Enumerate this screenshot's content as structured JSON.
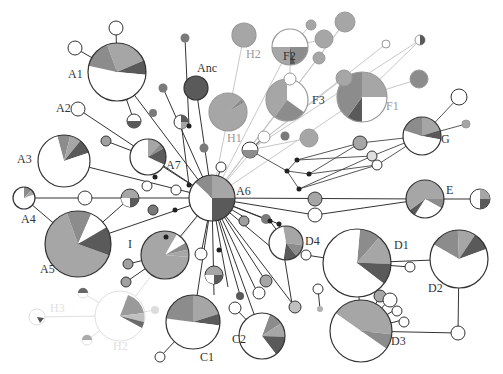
{
  "colors": {
    "c_light": "#a6a6a6",
    "c_mid": "#8c8c8c",
    "c_dark": "#5a5a5a",
    "c_white": "#ffffff",
    "c_solid": "#7a7a7a",
    "line_dark": "#333333",
    "line_light": "#c8c8c8",
    "ghost": "#dcdcdc"
  },
  "labels": [
    {
      "id": "A1",
      "text": "A1",
      "x": 68,
      "y": 78,
      "faded": false
    },
    {
      "id": "A2",
      "text": "A2",
      "x": 56,
      "y": 112,
      "faded": false
    },
    {
      "id": "A3",
      "text": "A3",
      "x": 17,
      "y": 163,
      "faded": false
    },
    {
      "id": "A4",
      "text": "A4",
      "x": 21,
      "y": 223,
      "faded": false
    },
    {
      "id": "A5",
      "text": "A5",
      "x": 40,
      "y": 273,
      "faded": false
    },
    {
      "id": "A6",
      "text": "A6",
      "x": 236,
      "y": 195,
      "faded": false
    },
    {
      "id": "A7",
      "text": "A7",
      "x": 166,
      "y": 169,
      "faded": false
    },
    {
      "id": "Anc",
      "text": "Anc",
      "x": 197,
      "y": 72,
      "faded": false
    },
    {
      "id": "H1",
      "text": "H1",
      "x": 227,
      "y": 142,
      "faded": true
    },
    {
      "id": "H2",
      "text": "H2",
      "x": 246,
      "y": 58,
      "faded": true
    },
    {
      "id": "F1",
      "text": "F1",
      "x": 386,
      "y": 110,
      "faded": true
    },
    {
      "id": "F2",
      "text": "F2",
      "x": 283,
      "y": 60,
      "faded": false
    },
    {
      "id": "F3",
      "text": "F3",
      "x": 312,
      "y": 104,
      "faded": false
    },
    {
      "id": "G",
      "text": "G",
      "x": 441,
      "y": 143,
      "faded": false
    },
    {
      "id": "E",
      "text": "E",
      "x": 446,
      "y": 194,
      "faded": false
    },
    {
      "id": "D1",
      "text": "D1",
      "x": 394,
      "y": 249,
      "faded": false
    },
    {
      "id": "D2",
      "text": "D2",
      "x": 428,
      "y": 292,
      "faded": false
    },
    {
      "id": "D3",
      "text": "D3",
      "x": 391,
      "y": 345,
      "faded": false
    },
    {
      "id": "D4",
      "text": "D4",
      "x": 305,
      "y": 245,
      "faded": false
    },
    {
      "id": "C1",
      "text": "C1",
      "x": 200,
      "y": 361,
      "faded": false
    },
    {
      "id": "C2",
      "text": "C2",
      "x": 232,
      "y": 343,
      "faded": false
    },
    {
      "id": "I",
      "text": "I",
      "x": 128,
      "y": 248,
      "faded": false
    },
    {
      "id": "H3",
      "text": "H3",
      "x": 50,
      "y": 312,
      "faded": true
    },
    {
      "id": "H2b",
      "text": "H2",
      "x": 113,
      "y": 350,
      "faded": true
    }
  ],
  "chart_data": {
    "type": "network",
    "title": "",
    "nodes": [
      {
        "id": "A1",
        "x": 117,
        "y": 72,
        "r": 29,
        "slices": [
          [
            "c_light",
            0.24
          ],
          [
            "c_dark",
            0.08
          ],
          [
            "c_white",
            0.52
          ],
          [
            "c_mid",
            0.16
          ]
        ],
        "start": -20
      },
      {
        "id": "A3",
        "x": 64,
        "y": 161,
        "r": 26,
        "slices": [
          [
            "c_mid",
            0.08
          ],
          [
            "c_light",
            0.07
          ],
          [
            "c_dark",
            0.09
          ],
          [
            "c_white",
            0.76
          ]
        ],
        "start": -15
      },
      {
        "id": "A4",
        "x": 24,
        "y": 198,
        "r": 11,
        "slices": [
          [
            "c_mid",
            0.12
          ],
          [
            "c_light",
            0.08
          ],
          [
            "c_white",
            0.8
          ]
        ],
        "start": 0
      },
      {
        "id": "A5",
        "x": 78,
        "y": 244,
        "r": 33,
        "slices": [
          [
            "c_light",
            0.64
          ],
          [
            "c_mid",
            0.12
          ],
          [
            "c_white",
            0.1
          ],
          [
            "c_dark",
            0.14
          ]
        ],
        "start": 110
      },
      {
        "id": "A6",
        "x": 212,
        "y": 198,
        "r": 23,
        "slices": [
          [
            "c_light",
            0.25
          ],
          [
            "c_dark",
            0.25
          ],
          [
            "c_white",
            0.37
          ],
          [
            "c_mid",
            0.13
          ]
        ],
        "start": 0
      },
      {
        "id": "A7",
        "x": 148,
        "y": 157,
        "r": 18,
        "slices": [
          [
            "c_light",
            0.12
          ],
          [
            "c_mid",
            0.05
          ],
          [
            "c_dark",
            0.15
          ],
          [
            "c_white",
            0.68
          ]
        ],
        "start": 0
      },
      {
        "id": "I",
        "x": 165,
        "y": 255,
        "r": 24,
        "slices": [
          [
            "c_light",
            0.82
          ],
          [
            "c_white",
            0.08
          ],
          [
            "c_mid",
            0.05
          ],
          [
            "c_light",
            0.05
          ]
        ],
        "start": 95
      },
      {
        "id": "C1",
        "x": 193,
        "y": 322,
        "r": 27,
        "slices": [
          [
            "c_light",
            0.2
          ],
          [
            "c_dark",
            0.07
          ],
          [
            "c_white",
            0.5
          ],
          [
            "c_mid",
            0.23
          ]
        ],
        "start": 0
      },
      {
        "id": "C2",
        "x": 262,
        "y": 336,
        "r": 23,
        "slices": [
          [
            "c_mid",
            0.1
          ],
          [
            "c_light",
            0.1
          ],
          [
            "c_dark",
            0.14
          ],
          [
            "c_white",
            0.66
          ]
        ],
        "start": 20
      },
      {
        "id": "D1",
        "x": 357,
        "y": 263,
        "r": 34,
        "slices": [
          [
            "c_mid",
            0.1
          ],
          [
            "c_light",
            0.14
          ],
          [
            "c_dark",
            0.1
          ],
          [
            "c_white",
            0.66
          ]
        ],
        "start": 5
      },
      {
        "id": "D2",
        "x": 459,
        "y": 259,
        "r": 29,
        "slices": [
          [
            "c_mid",
            0.16
          ],
          [
            "c_light",
            0.1
          ],
          [
            "c_dark",
            0.1
          ],
          [
            "c_white",
            0.64
          ]
        ],
        "start": -60
      },
      {
        "id": "D3",
        "x": 361,
        "y": 331,
        "r": 31,
        "slices": [
          [
            "c_light",
            0.42
          ],
          [
            "c_mid",
            0.08
          ],
          [
            "c_white",
            0.5
          ]
        ],
        "start": -55
      },
      {
        "id": "D4",
        "x": 286,
        "y": 243,
        "r": 17,
        "slices": [
          [
            "c_light",
            0.3
          ],
          [
            "c_mid",
            0.12
          ],
          [
            "c_dark",
            0.13
          ],
          [
            "c_white",
            0.45
          ]
        ],
        "start": -10
      },
      {
        "id": "E",
        "x": 425,
        "y": 199,
        "r": 19,
        "slices": [
          [
            "c_light",
            0.5
          ],
          [
            "c_mid",
            0.08
          ],
          [
            "c_white",
            0.26
          ],
          [
            "c_dark",
            0.06
          ],
          [
            "c_light",
            0.1
          ]
        ],
        "start": -90
      },
      {
        "id": "G",
        "x": 422,
        "y": 136,
        "r": 19,
        "slices": [
          [
            "c_light",
            0.2
          ],
          [
            "c_dark",
            0.08
          ],
          [
            "c_white",
            0.52
          ],
          [
            "c_mid",
            0.2
          ]
        ],
        "start": 0
      },
      {
        "id": "F1",
        "x": 362,
        "y": 97,
        "r": 25,
        "slices": [
          [
            "c_light",
            0.25
          ],
          [
            "c_white",
            0.25
          ],
          [
            "c_dark",
            0.1
          ],
          [
            "c_mid",
            0.4
          ]
        ],
        "start": 0
      },
      {
        "id": "F2",
        "x": 290,
        "y": 47,
        "r": 18,
        "slices": [
          [
            "c_white",
            0.5
          ],
          [
            "c_mid",
            0.2
          ],
          [
            "c_dark",
            0.05
          ],
          [
            "c_light",
            0.25
          ]
        ],
        "start": -90
      },
      {
        "id": "F3",
        "x": 287,
        "y": 100,
        "r": 21,
        "slices": [
          [
            "c_white",
            0.35
          ],
          [
            "c_mid",
            0.25
          ],
          [
            "c_light",
            0.4
          ]
        ],
        "start": 0
      },
      {
        "id": "Anc",
        "x": 196,
        "y": 88,
        "r": 12,
        "slices": [
          [
            "c_dark",
            1
          ]
        ],
        "start": 0
      },
      {
        "id": "H1",
        "x": 228,
        "y": 112,
        "r": 19,
        "slices": [
          [
            "c_light",
            0.96
          ],
          [
            "c_mid",
            0.04
          ]
        ],
        "start": 60
      },
      {
        "id": "H2",
        "x": 244,
        "y": 35,
        "r": 12,
        "slices": [
          [
            "c_light",
            1
          ]
        ],
        "start": 0
      }
    ],
    "edges_note": "Lines connect haplotype nodes; small dots are median vectors; faded (light gray) elements are peripheral lineages H1-H3/F"
  }
}
